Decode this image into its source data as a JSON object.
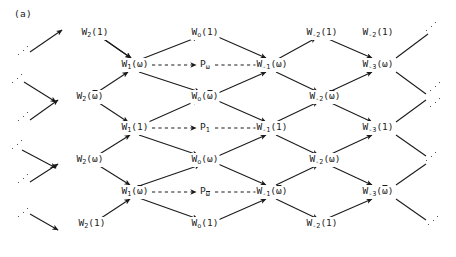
{
  "figure": {
    "panel_label": "(a)",
    "type": "lattice-diagram",
    "columns_x": [
      95,
      135,
      205,
      272,
      322,
      378
    ],
    "rows_y": [
      33,
      65,
      97,
      128,
      160,
      192,
      224
    ],
    "nodes": [
      {
        "id": "n0",
        "label": "W₂(1)",
        "base": "W",
        "sub": "2",
        "arg": "(1)",
        "x": 95,
        "y": 33
      },
      {
        "id": "n1",
        "label": "W₁(ω)",
        "base": "W",
        "sub": "1",
        "arg": "(ω)",
        "x": 135,
        "y": 65
      },
      {
        "id": "n2",
        "label": "W₂(ω̄)",
        "base": "W",
        "sub": "2",
        "arg": "(ω̄)",
        "x": 90,
        "y": 97
      },
      {
        "id": "n3",
        "label": "W₁(1)",
        "base": "W",
        "sub": "1",
        "arg": "(1)",
        "x": 135,
        "y": 128
      },
      {
        "id": "n4",
        "label": "W₂(ω)",
        "base": "W",
        "sub": "2",
        "arg": "(ω)",
        "x": 90,
        "y": 160
      },
      {
        "id": "n5",
        "label": "W₁(ω̄)",
        "base": "W",
        "sub": "1",
        "arg": "(ω̄)",
        "x": 135,
        "y": 192
      },
      {
        "id": "n6",
        "label": "W₂(1)",
        "base": "W",
        "sub": "2",
        "arg": "(1)",
        "x": 92,
        "y": 224
      },
      {
        "id": "m0",
        "label": "W₀(1)",
        "base": "W",
        "sub": "o",
        "arg": "(1)",
        "x": 205,
        "y": 33
      },
      {
        "id": "p0",
        "label": "P_ω",
        "base": "P",
        "sub": "ω",
        "arg": "",
        "x": 205,
        "y": 65
      },
      {
        "id": "m1",
        "label": "W₀(ω̄)",
        "base": "W",
        "sub": "o",
        "arg": "(ω̄)",
        "x": 205,
        "y": 97
      },
      {
        "id": "p1",
        "label": "P₁",
        "base": "P",
        "sub": "1",
        "arg": "",
        "x": 205,
        "y": 128
      },
      {
        "id": "m2",
        "label": "W₀(ω)",
        "base": "W",
        "sub": "o",
        "arg": "(ω)",
        "x": 205,
        "y": 160
      },
      {
        "id": "p2",
        "label": "P_ω̄",
        "base": "P",
        "sub": "ω̄",
        "arg": "",
        "x": 205,
        "y": 192
      },
      {
        "id": "m3",
        "label": "W₀(1)",
        "base": "W",
        "sub": "o",
        "arg": "(1)",
        "x": 205,
        "y": 224
      },
      {
        "id": "r0",
        "label": "W₋₂(1)",
        "base": "W",
        "sub": "-2",
        "arg": "(1)",
        "x": 322,
        "y": 33
      },
      {
        "id": "r1",
        "label": "W₋₁(ω)",
        "base": "W",
        "sub": "-1",
        "arg": "(ω)",
        "x": 272,
        "y": 65
      },
      {
        "id": "r2",
        "label": "W₋₂(ω̄)",
        "base": "W",
        "sub": "-2",
        "arg": "(ω̄)",
        "x": 325,
        "y": 97
      },
      {
        "id": "r3",
        "label": "W₋₁(1)",
        "base": "W",
        "sub": "-1",
        "arg": "(1)",
        "x": 272,
        "y": 128
      },
      {
        "id": "r4",
        "label": "W₋₂(ω)",
        "base": "W",
        "sub": "-2",
        "arg": "(ω)",
        "x": 325,
        "y": 160
      },
      {
        "id": "r5",
        "label": "W₋₁(ω̄)",
        "base": "W",
        "sub": "-1",
        "arg": "(ω̄)",
        "x": 272,
        "y": 192
      },
      {
        "id": "r6",
        "label": "W₋₂(1)",
        "base": "W",
        "sub": "-2",
        "arg": "(1)",
        "x": 322,
        "y": 224
      },
      {
        "id": "f0",
        "label": "W₋₂(1)",
        "base": "W",
        "sub": "-2",
        "arg": "(1)",
        "x": 378,
        "y": 33
      },
      {
        "id": "f1",
        "label": "W₋₃(ω)",
        "base": "W",
        "sub": "-3",
        "arg": "(ω)",
        "x": 378,
        "y": 65
      },
      {
        "id": "f2",
        "label": "W₋₃(1)",
        "base": "W",
        "sub": "-3",
        "arg": "(1)",
        "x": 378,
        "y": 128
      },
      {
        "id": "f3",
        "label": "W₋₃(ω̄)",
        "base": "W",
        "sub": "-3",
        "arg": "(ω̄)",
        "x": 378,
        "y": 192
      }
    ],
    "extra_top_right": {
      "label": "W₋₂(1)",
      "x": 322,
      "y": 33
    },
    "solid_edges": [
      [
        95,
        33,
        131,
        58
      ],
      [
        90,
        97,
        128,
        72
      ],
      [
        139,
        60,
        198,
        37
      ],
      [
        139,
        72,
        200,
        92
      ],
      [
        90,
        97,
        128,
        122
      ],
      [
        95,
        33,
        131,
        58
      ],
      [
        139,
        135,
        198,
        155
      ],
      [
        135,
        128,
        198,
        100
      ],
      [
        90,
        160,
        130,
        135
      ],
      [
        90,
        160,
        130,
        185
      ],
      [
        92,
        224,
        130,
        199
      ],
      [
        139,
        198,
        198,
        219
      ],
      [
        139,
        186,
        200,
        165
      ],
      [
        209,
        33,
        266,
        58
      ],
      [
        209,
        97,
        266,
        72
      ],
      [
        209,
        97,
        266,
        122
      ],
      [
        209,
        160,
        266,
        135
      ],
      [
        209,
        160,
        266,
        185
      ],
      [
        209,
        224,
        266,
        199
      ],
      [
        276,
        60,
        316,
        38
      ],
      [
        276,
        72,
        318,
        92
      ],
      [
        276,
        122,
        318,
        102
      ],
      [
        276,
        135,
        318,
        155
      ],
      [
        276,
        185,
        318,
        165
      ],
      [
        276,
        199,
        318,
        219
      ],
      [
        326,
        38,
        372,
        58
      ],
      [
        329,
        92,
        372,
        72
      ],
      [
        329,
        102,
        372,
        122
      ],
      [
        329,
        155,
        372,
        135
      ],
      [
        329,
        165,
        372,
        185
      ],
      [
        326,
        219,
        372,
        199
      ]
    ],
    "dashed_edges": [
      [
        152,
        65,
        196,
        65
      ],
      [
        215,
        65,
        262,
        65
      ],
      [
        152,
        128,
        196,
        128
      ],
      [
        215,
        128,
        262,
        128
      ],
      [
        152,
        192,
        196,
        192
      ],
      [
        215,
        192,
        262,
        192
      ]
    ],
    "ellipsis_marks": [
      {
        "x": 24,
        "y": 52
      },
      {
        "x": 18,
        "y": 80
      },
      {
        "x": 24,
        "y": 118
      },
      {
        "x": 18,
        "y": 146
      },
      {
        "x": 24,
        "y": 180
      },
      {
        "x": 24,
        "y": 214
      },
      {
        "x": 432,
        "y": 28
      },
      {
        "x": 436,
        "y": 88
      },
      {
        "x": 436,
        "y": 104
      },
      {
        "x": 432,
        "y": 158
      },
      {
        "x": 434,
        "y": 222
      }
    ],
    "incoming_stub_arrows": [
      [
        30,
        52,
        62,
        30
      ],
      [
        24,
        82,
        56,
        102
      ],
      [
        30,
        120,
        58,
        100
      ],
      [
        22,
        150,
        56,
        168
      ],
      [
        30,
        182,
        58,
        164
      ],
      [
        30,
        214,
        58,
        230
      ]
    ],
    "outgoing_stub_lines": [
      [
        396,
        58,
        428,
        34
      ],
      [
        396,
        72,
        426,
        94
      ],
      [
        396,
        122,
        426,
        100
      ],
      [
        396,
        135,
        426,
        156
      ],
      [
        396,
        185,
        426,
        164
      ],
      [
        396,
        199,
        426,
        220
      ]
    ]
  }
}
